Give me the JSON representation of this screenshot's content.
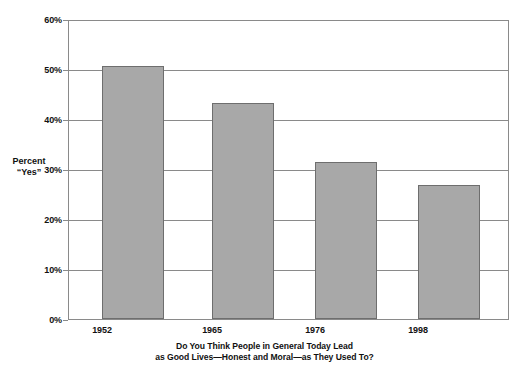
{
  "chart_data": {
    "type": "bar",
    "title": "",
    "caption_lines": [
      "Do You Think People in General Today Lead",
      "as Good Lives—Honest and Moral—as They Used To?"
    ],
    "categories": [
      "1952",
      "1965",
      "1976",
      "1998"
    ],
    "values": [
      50.6,
      43.2,
      31.5,
      26.8
    ],
    "xlabel": "",
    "ylabel_lines": [
      "Percent",
      "“Yes”"
    ],
    "ylim": [
      0,
      60
    ],
    "ytick_values": [
      0,
      10,
      20,
      30,
      40,
      50,
      60
    ],
    "ytick_labels": [
      "0%",
      "10%",
      "20%",
      "30%",
      "40%",
      "50%",
      "60%"
    ],
    "grid": true,
    "legend": "none",
    "bar_color": "#a8a8a8",
    "bar_border_color": "#6e6e6e",
    "axis_color": "#8a8a8a",
    "background_color": "#ffffff"
  }
}
